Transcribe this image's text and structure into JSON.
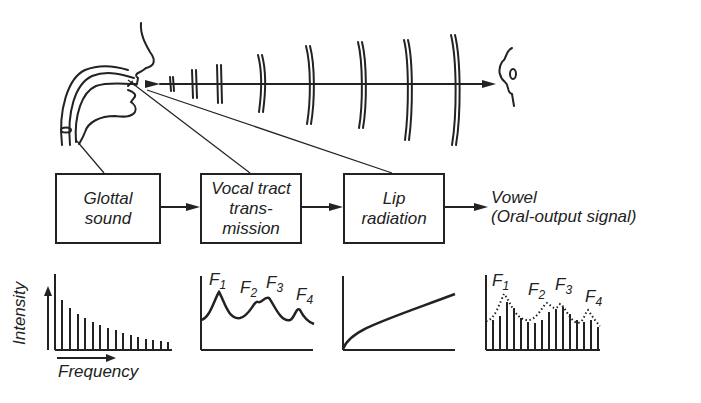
{
  "diagram": {
    "blocks": [
      {
        "id": "glottal",
        "label": "Glottal\nsound"
      },
      {
        "id": "vocal-tract",
        "label": "Vocal tract\ntrans-\nmission"
      },
      {
        "id": "lip",
        "label": "Lip\nradiation"
      }
    ],
    "output": {
      "line1": "Vowel",
      "line2": "(Oral-output signal)"
    },
    "axes": {
      "y_label": "Intensity",
      "x_label": "Frequency"
    },
    "formants": {
      "vocal_tract": [
        "F",
        "F",
        "F",
        "F"
      ],
      "vocal_tract_sub": [
        "1",
        "2",
        "3",
        "4"
      ],
      "output": [
        "F",
        "F",
        "F",
        "F"
      ],
      "output_sub": [
        "1",
        "2",
        "3",
        "4"
      ]
    },
    "colors": {
      "ink": "#222222",
      "background": "#ffffff"
    }
  }
}
